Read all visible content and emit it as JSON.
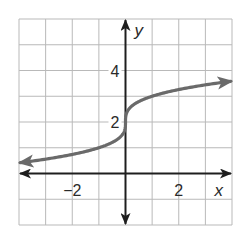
{
  "chart_data": {
    "type": "line",
    "title": "",
    "xlabel": "x",
    "ylabel": "y",
    "xlim": [
      -4,
      4
    ],
    "ylim": [
      -2,
      6
    ],
    "grid": true,
    "grid_step": 1,
    "x_tick_labels": [
      {
        "value": -2,
        "label": "−2"
      },
      {
        "value": 2,
        "label": "2"
      }
    ],
    "y_tick_labels": [
      {
        "value": 2,
        "label": "2"
      },
      {
        "value": 4,
        "label": "4"
      }
    ],
    "series": [
      {
        "name": "y = ∛x + 2",
        "function": "cbrt(x) + 2",
        "color": "#6a6a6a",
        "arrows": "both",
        "x": [
          -3.95,
          -3,
          -2,
          -1,
          -0.5,
          -0.125,
          0,
          0.125,
          0.5,
          1,
          2,
          3,
          3.95
        ],
        "y": [
          0.42,
          0.56,
          0.74,
          1.0,
          1.21,
          1.5,
          2.0,
          2.5,
          2.79,
          3.0,
          3.26,
          3.44,
          3.58
        ]
      }
    ],
    "colors": {
      "axis": "#1e1e1e",
      "grid": "#b9b9b9",
      "curve": "#6a6a6a"
    }
  }
}
